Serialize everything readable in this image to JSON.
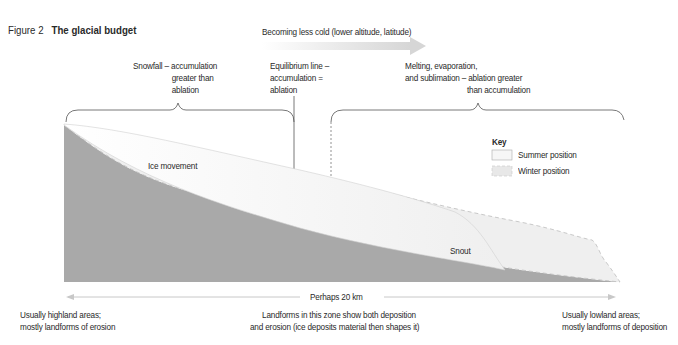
{
  "figure": {
    "number": "Figure 2",
    "title": "The glacial budget"
  },
  "gradient_arrow": {
    "label": "Becoming less cold (lower altitude, latitude)"
  },
  "zones": {
    "accumulation": {
      "line1": "Snowfall – accumulation",
      "line2": "greater than",
      "line3": "ablation"
    },
    "equilibrium": {
      "line1": "Equilibrium line –",
      "line2": "accumulation =",
      "line3": "ablation"
    },
    "ablation": {
      "line1": "Melting, evaporation,",
      "line2": "and sublimation – ablation greater",
      "line3": "than accumulation"
    }
  },
  "glacier_labels": {
    "ice_movement": "Ice movement",
    "snout": "Snout"
  },
  "key": {
    "title": "Key",
    "items": [
      {
        "label": "Summer position",
        "color": "#f4f4f4"
      },
      {
        "label": "Winter position",
        "color": "#e6e6e6"
      }
    ]
  },
  "distance": {
    "label": "Perhaps 20 km"
  },
  "bottom_notes": {
    "left": {
      "line1": "Usually highland areas;",
      "line2": "mostly landforms of erosion"
    },
    "center": {
      "line1": "Landforms in this zone show both deposition",
      "line2": "and erosion (ice deposits material then shapes it)"
    },
    "right": {
      "line1": "Usually lowland areas;",
      "line2": "mostly landforms of deposition"
    }
  },
  "colors": {
    "bedrock": "#a9a9a9",
    "ice": "#f7f7f7",
    "arrow": "#dcdcdc",
    "line": "#555555"
  }
}
